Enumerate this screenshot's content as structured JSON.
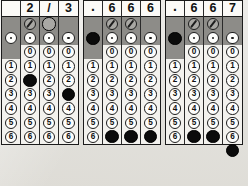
{
  "sheet": {
    "label": "student-response-grid-sheet",
    "ink_color": "#0b0b0b",
    "shade_color": "#8d8c88",
    "paper_color": "#e8e7e3"
  },
  "glyphs": {
    "slash": "/",
    "decimal": ".",
    "empty": ""
  },
  "digit_labels": [
    "0",
    "1",
    "2",
    "3",
    "4",
    "5",
    "6"
  ],
  "grids": [
    {
      "name": "grid-1",
      "written_answer": [
        "",
        "2",
        "/",
        "3"
      ],
      "columns": [
        {
          "name": "grid-1-column-1",
          "slash": {
            "present": false,
            "filled": false
          },
          "decimal": {
            "present": true,
            "filled": false
          },
          "zero": {
            "present": false,
            "filled": false
          },
          "digits_present": [
            "1",
            "2",
            "3",
            "4",
            "5",
            "6"
          ],
          "filled_digit": null
        },
        {
          "name": "grid-1-column-2",
          "slash": {
            "present": true,
            "filled": false
          },
          "decimal": {
            "present": true,
            "filled": false
          },
          "zero": {
            "present": true,
            "filled": false
          },
          "digits_present": [
            "1",
            "2",
            "3",
            "4",
            "5",
            "6"
          ],
          "filled_digit": "2"
        },
        {
          "name": "grid-1-column-3",
          "slash": {
            "present": true,
            "filled": true
          },
          "decimal": {
            "present": true,
            "filled": false
          },
          "zero": {
            "present": true,
            "filled": false
          },
          "digits_present": [
            "1",
            "2",
            "3",
            "4",
            "5",
            "6"
          ],
          "filled_digit": null
        },
        {
          "name": "grid-1-column-4",
          "slash": {
            "present": false,
            "filled": false
          },
          "decimal": {
            "present": true,
            "filled": false
          },
          "zero": {
            "present": true,
            "filled": false
          },
          "digits_present": [
            "1",
            "2",
            "3",
            "4",
            "5",
            "6"
          ],
          "filled_digit": "3"
        }
      ]
    },
    {
      "name": "grid-2",
      "written_answer": [
        ".",
        "6",
        "6",
        "6"
      ],
      "columns": [
        {
          "name": "grid-2-column-1",
          "slash": {
            "present": false,
            "filled": false
          },
          "decimal": {
            "present": true,
            "filled": true
          },
          "zero": {
            "present": false,
            "filled": false
          },
          "digits_present": [
            "1",
            "2",
            "3",
            "4",
            "5",
            "6"
          ],
          "filled_digit": null
        },
        {
          "name": "grid-2-column-2",
          "slash": {
            "present": true,
            "filled": false
          },
          "decimal": {
            "present": true,
            "filled": false
          },
          "zero": {
            "present": true,
            "filled": false
          },
          "digits_present": [
            "1",
            "2",
            "3",
            "4",
            "5",
            "6"
          ],
          "filled_digit": "6"
        },
        {
          "name": "grid-2-column-3",
          "slash": {
            "present": true,
            "filled": false
          },
          "decimal": {
            "present": true,
            "filled": false
          },
          "zero": {
            "present": true,
            "filled": false
          },
          "digits_present": [
            "1",
            "2",
            "3",
            "4",
            "5",
            "6"
          ],
          "filled_digit": "6"
        },
        {
          "name": "grid-2-column-4",
          "slash": {
            "present": false,
            "filled": false
          },
          "decimal": {
            "present": true,
            "filled": false
          },
          "zero": {
            "present": true,
            "filled": false
          },
          "digits_present": [
            "1",
            "2",
            "3",
            "4",
            "5",
            "6"
          ],
          "filled_digit": "6"
        }
      ]
    },
    {
      "name": "grid-3",
      "written_answer": [
        ".",
        "6",
        "6",
        "7"
      ],
      "columns": [
        {
          "name": "grid-3-column-1",
          "slash": {
            "present": false,
            "filled": false
          },
          "decimal": {
            "present": true,
            "filled": true
          },
          "zero": {
            "present": false,
            "filled": false
          },
          "digits_present": [
            "1",
            "2",
            "3",
            "4",
            "5",
            "6"
          ],
          "filled_digit": null
        },
        {
          "name": "grid-3-column-2",
          "slash": {
            "present": true,
            "filled": false
          },
          "decimal": {
            "present": true,
            "filled": false
          },
          "zero": {
            "present": true,
            "filled": false
          },
          "digits_present": [
            "1",
            "2",
            "3",
            "4",
            "5",
            "6"
          ],
          "filled_digit": "6"
        },
        {
          "name": "grid-3-column-3",
          "slash": {
            "present": true,
            "filled": false
          },
          "decimal": {
            "present": true,
            "filled": false
          },
          "zero": {
            "present": true,
            "filled": false
          },
          "digits_present": [
            "1",
            "2",
            "3",
            "4",
            "5",
            "6"
          ],
          "filled_digit": "6"
        },
        {
          "name": "grid-3-column-4",
          "slash": {
            "present": false,
            "filled": false
          },
          "decimal": {
            "present": true,
            "filled": false
          },
          "zero": {
            "present": true,
            "filled": false
          },
          "digits_present": [
            "1",
            "2",
            "3",
            "4",
            "5",
            "6"
          ],
          "filled_digit": null,
          "overhang_filled": true
        }
      ]
    }
  ]
}
